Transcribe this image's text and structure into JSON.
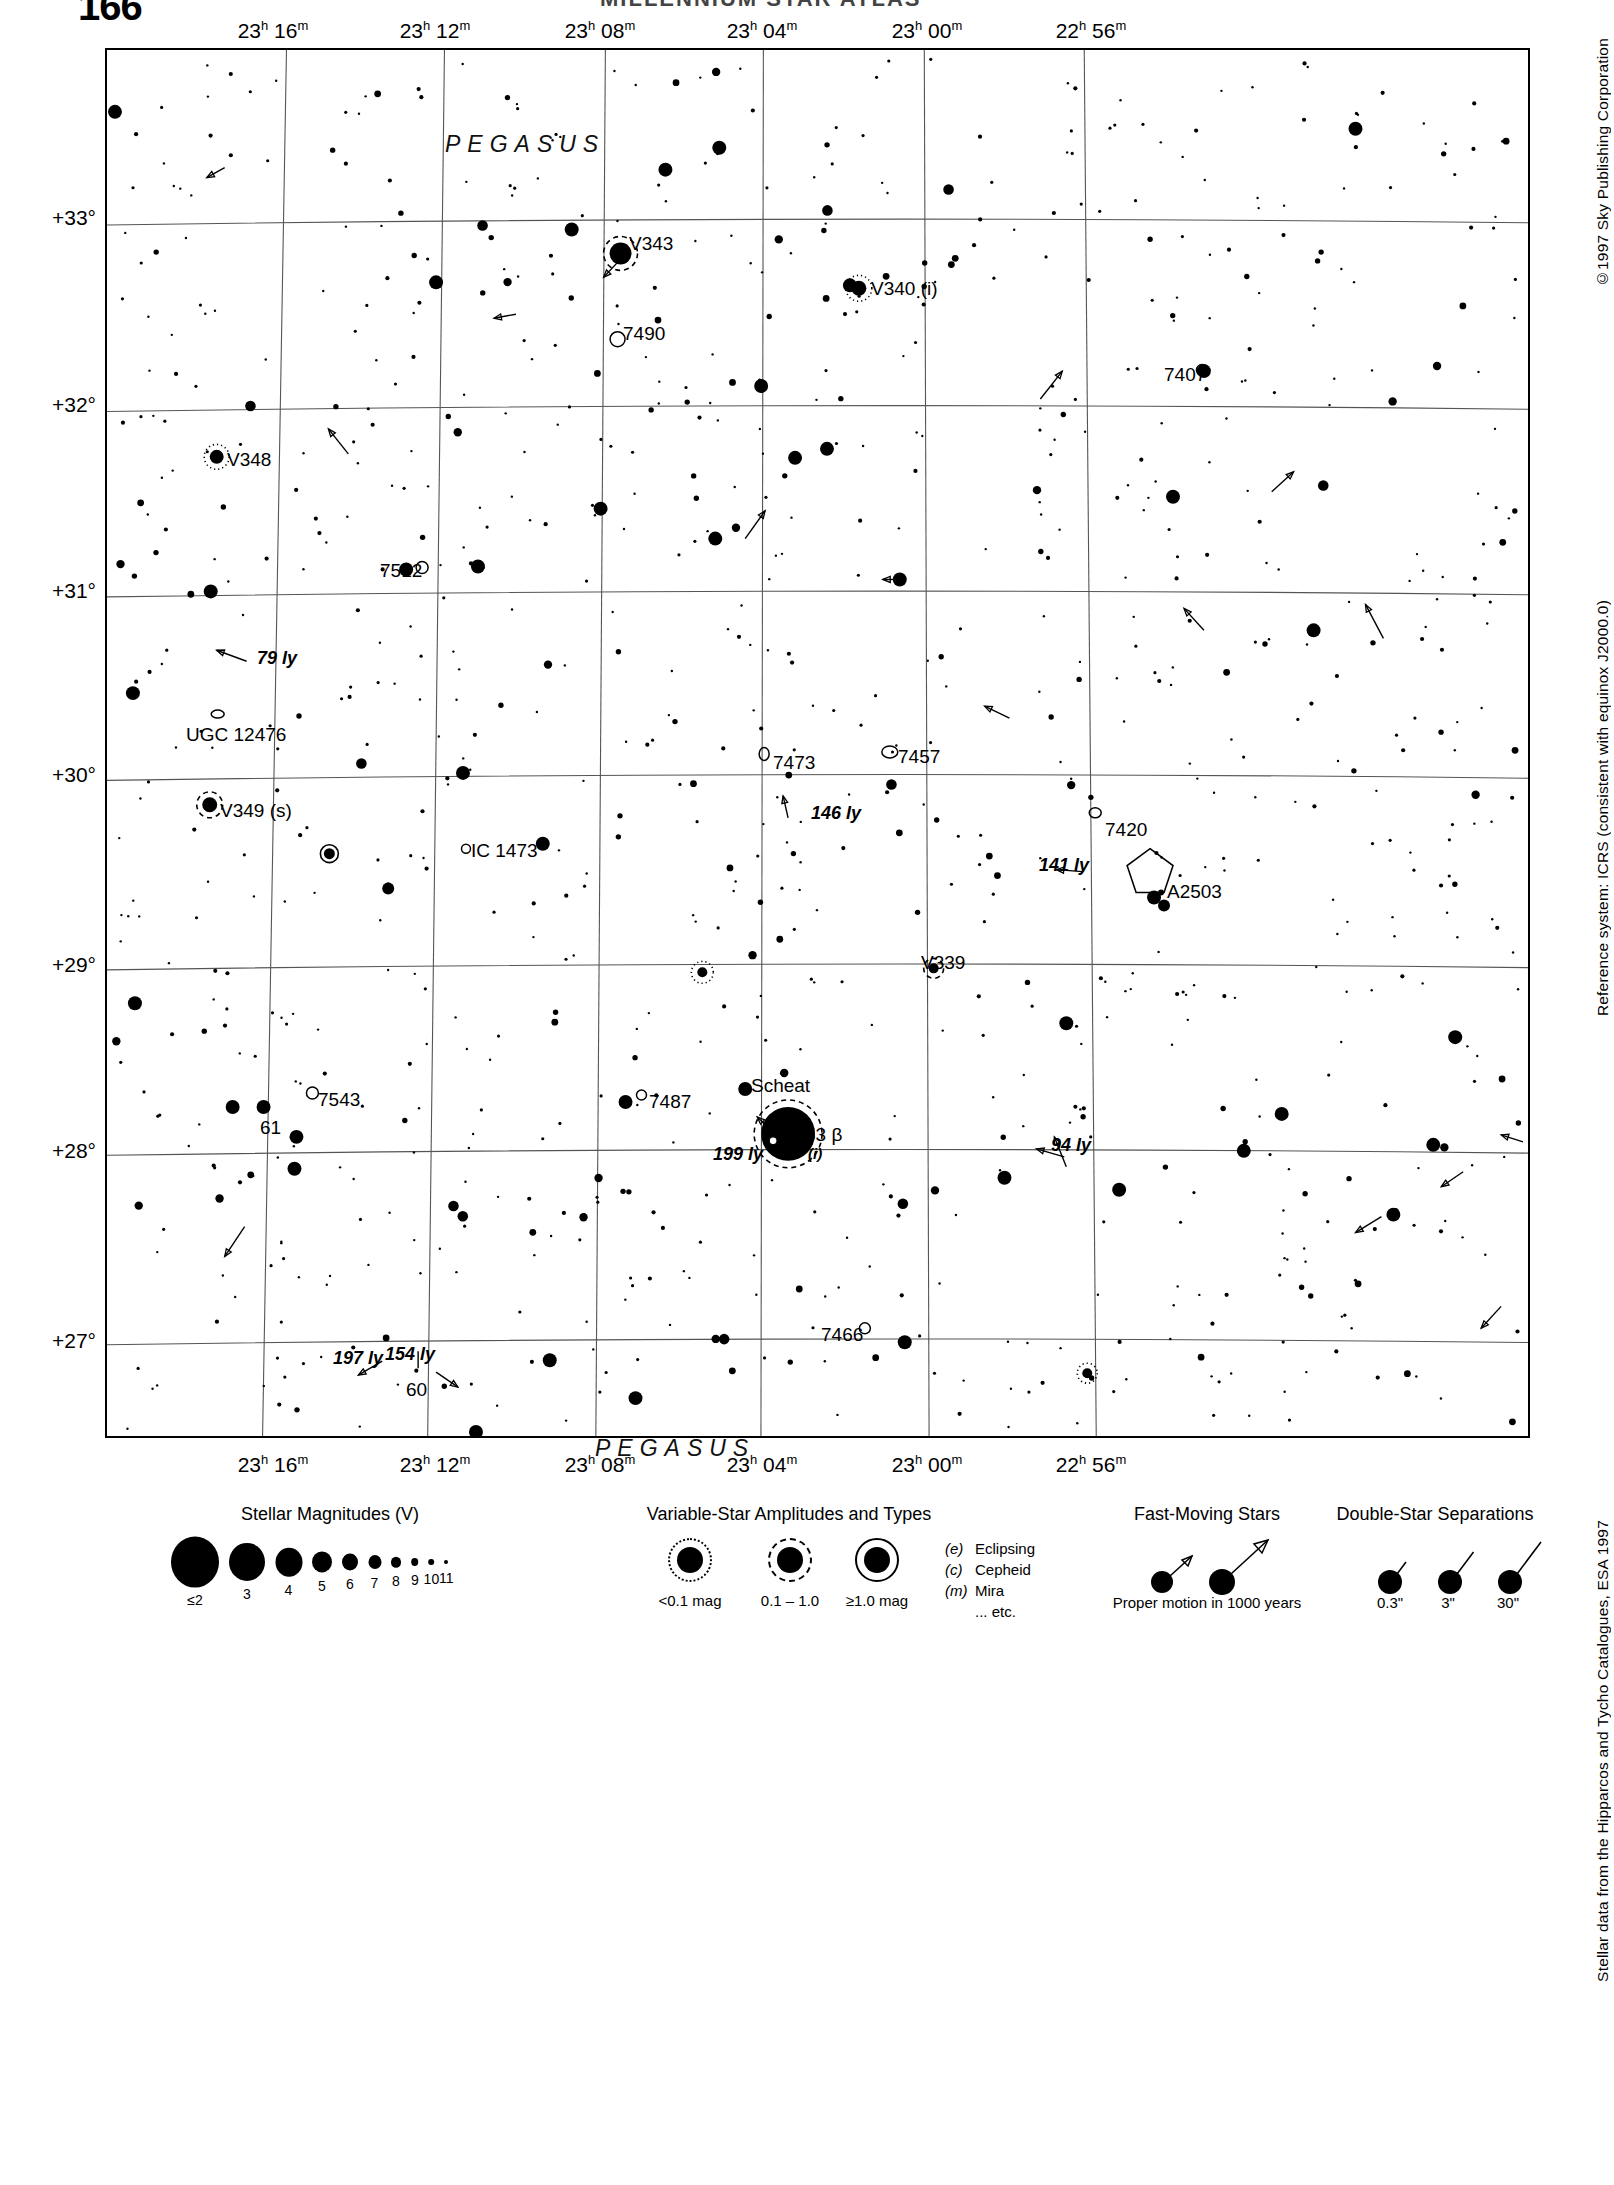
{
  "page": {
    "number_top": "166",
    "header_title": "MILLENNIUM STAR ATLAS",
    "number_legend": "1163",
    "adjacent_chart": "1185"
  },
  "side_notes": {
    "copyright": "©1997 Sky Publishing Corporation",
    "reference": "Reference system: ICRS (consistent with equinox J2000.0)",
    "catalogue": "Stellar data from the Hipparcos and Tycho Catalogues, ESA 1997"
  },
  "axes": {
    "ra_ticks": [
      {
        "label": "23h 16m",
        "h": "23",
        "m": "16",
        "x": 168
      },
      {
        "label": "23h 12m",
        "h": "23",
        "m": "12",
        "x": 330
      },
      {
        "label": "23h 08m",
        "h": "23",
        "m": "08",
        "x": 495
      },
      {
        "label": "23h 04m",
        "h": "23",
        "m": "04",
        "x": 657
      },
      {
        "label": "23h 00m",
        "h": "23",
        "m": "00",
        "x": 822
      },
      {
        "label": "22h 56m",
        "h": "22",
        "m": "56",
        "x": 986
      }
    ],
    "dec_ticks": [
      {
        "label": "+33°",
        "y": 170
      },
      {
        "label": "+32°",
        "y": 357
      },
      {
        "label": "+31°",
        "y": 543
      },
      {
        "label": "+30°",
        "y": 727
      },
      {
        "label": "+29°",
        "y": 917
      },
      {
        "label": "+28°",
        "y": 1103
      },
      {
        "label": "+27°",
        "y": 1293
      }
    ]
  },
  "constellation_labels": [
    {
      "name": "PEGASUS",
      "x": 340,
      "y": 83
    },
    {
      "name": "PEGASUS",
      "x": 490,
      "y": 1387
    }
  ],
  "object_labels": [
    {
      "name": "V343",
      "x": 524,
      "y": 186,
      "style": "plain"
    },
    {
      "name": "V340 (i)",
      "x": 766,
      "y": 231,
      "style": "plain"
    },
    {
      "name": "7490",
      "x": 518,
      "y": 276,
      "style": "plain"
    },
    {
      "name": "7407",
      "x": 1059,
      "y": 317,
      "style": "plain"
    },
    {
      "name": "V348",
      "x": 122,
      "y": 402,
      "style": "plain"
    },
    {
      "name": "7512",
      "x": 275,
      "y": 513,
      "style": "plain"
    },
    {
      "name": "79 ly",
      "x": 152,
      "y": 601,
      "style": "italic"
    },
    {
      "name": "UGC 12476",
      "x": 81,
      "y": 677,
      "style": "plain"
    },
    {
      "name": "7473",
      "x": 668,
      "y": 705,
      "style": "plain"
    },
    {
      "name": "7457",
      "x": 793,
      "y": 699,
      "style": "plain"
    },
    {
      "name": "V349 (s)",
      "x": 115,
      "y": 753,
      "style": "plain"
    },
    {
      "name": "146 ly",
      "x": 706,
      "y": 756,
      "style": "italic"
    },
    {
      "name": "7420",
      "x": 1000,
      "y": 772,
      "style": "plain"
    },
    {
      "name": "IC 1473",
      "x": 366,
      "y": 793,
      "style": "plain"
    },
    {
      "name": "141 ly",
      "x": 934,
      "y": 808,
      "style": "italic"
    },
    {
      "name": "A2503",
      "x": 1062,
      "y": 834,
      "style": "plain"
    },
    {
      "name": "V339",
      "x": 816,
      "y": 905,
      "style": "plain"
    },
    {
      "name": "7543",
      "x": 213,
      "y": 1042,
      "style": "plain"
    },
    {
      "name": "61",
      "x": 155,
      "y": 1070,
      "style": "plain"
    },
    {
      "name": "Scheat",
      "x": 646,
      "y": 1028,
      "style": "plain"
    },
    {
      "name": "7487",
      "x": 544,
      "y": 1044,
      "style": "plain"
    },
    {
      "name": "53 β",
      "x": 700,
      "y": 1077,
      "style": "plain"
    },
    {
      "name": "(i)",
      "x": 703,
      "y": 1098,
      "style": "italic-small"
    },
    {
      "name": "199 ly",
      "x": 608,
      "y": 1097,
      "style": "italic"
    },
    {
      "name": "94 ly",
      "x": 946,
      "y": 1088,
      "style": "italic"
    },
    {
      "name": "7466",
      "x": 716,
      "y": 1277,
      "style": "plain"
    },
    {
      "name": "197 ly",
      "x": 228,
      "y": 1301,
      "style": "italic"
    },
    {
      "name": "154 ly",
      "x": 280,
      "y": 1297,
      "style": "italic"
    },
    {
      "name": "60",
      "x": 301,
      "y": 1332,
      "style": "plain"
    }
  ],
  "legend": {
    "magnitudes": {
      "title": "Stellar Magnitudes (V)",
      "steps": [
        {
          "label": "≤2",
          "r": 24
        },
        {
          "label": "3",
          "r": 18
        },
        {
          "label": "4",
          "r": 13.5
        },
        {
          "label": "5",
          "r": 10
        },
        {
          "label": "6",
          "r": 8
        },
        {
          "label": "7",
          "r": 6.5
        },
        {
          "label": "8",
          "r": 5
        },
        {
          "label": "9",
          "r": 3.8
        },
        {
          "label": "10",
          "r": 2.8
        },
        {
          "label": "11",
          "r": 2
        }
      ]
    },
    "variables": {
      "title": "Variable-Star Amplitudes and Types",
      "samples": [
        {
          "label": "<0.1 mag",
          "ring": "dotted"
        },
        {
          "label": "0.1 – 1.0",
          "ring": "dashed"
        },
        {
          "label": "≥1.0 mag",
          "ring": "solid"
        }
      ],
      "types": [
        {
          "code": "(e)",
          "name": "Eclipsing"
        },
        {
          "code": "(c)",
          "name": "Cepheid"
        },
        {
          "code": "(m)",
          "name": "Mira"
        },
        {
          "code": "",
          "name": "... etc."
        }
      ]
    },
    "fast_moving": {
      "title": "Fast-Moving Stars",
      "caption": "Proper motion in 1000 years"
    },
    "doubles": {
      "title": "Double-Star Separations",
      "labels": [
        "0.3\"",
        "3\"",
        "30\""
      ]
    }
  },
  "chart_data": {
    "type": "scatter",
    "xlabel": "Right Ascension (J2000.0)",
    "ylabel": "Declination (J2000.0)",
    "xlim": [
      "23h 18m",
      "22h 54m"
    ],
    "ylim": [
      "+26.5°",
      "+33.6°"
    ],
    "grid": true,
    "ra_range_minutes": [
      1374,
      1374
    ],
    "seed": 1163,
    "named_objects": [
      {
        "id": "Scheat",
        "bayer": "53 β",
        "type": "variable-star",
        "amplitude": "0.1 - 1.0",
        "mag": 2.4,
        "distance_ly": 199,
        "note": "(i)",
        "x": 683,
        "y": 1087
      },
      {
        "id": "V343",
        "type": "variable-star",
        "amplitude": "0.1 - 1.0",
        "mag": 4.5,
        "x": 515,
        "y": 204
      },
      {
        "id": "V340",
        "type": "variable-star",
        "amplitude": "<0.1 mag",
        "mag": 5.5,
        "note": "(i)",
        "x": 754,
        "y": 239
      },
      {
        "id": "V348",
        "type": "variable-star",
        "amplitude": "<0.1 mag",
        "mag": 5.8,
        "x": 110,
        "y": 408
      },
      {
        "id": "V349",
        "type": "variable-star",
        "amplitude": "0.1 - 1.0",
        "mag": 5.6,
        "note": "(s)",
        "x": 103,
        "y": 757
      },
      {
        "id": "V339",
        "type": "variable-star",
        "amplitude": "<0.1 mag",
        "mag": 7.5,
        "x": 829,
        "y": 921
      },
      {
        "id": "61",
        "type": "star",
        "mag": 3.9,
        "x": 157,
        "y": 1060
      },
      {
        "id": "60",
        "type": "star",
        "mag": 4.2,
        "distance_ly": 154,
        "x": 320,
        "y": 1321
      },
      {
        "id": "7490",
        "type": "nebula",
        "x": 512,
        "y": 290
      },
      {
        "id": "7512",
        "type": "galaxy",
        "x": 316,
        "y": 519
      },
      {
        "id": "7543",
        "type": "galaxy",
        "x": 206,
        "y": 1046
      },
      {
        "id": "7487",
        "type": "galaxy",
        "x": 536,
        "y": 1048
      },
      {
        "id": "7473",
        "type": "galaxy",
        "x": 659,
        "y": 706
      },
      {
        "id": "7457",
        "type": "galaxy",
        "x": 785,
        "y": 704
      },
      {
        "id": "7466",
        "type": "galaxy",
        "x": 760,
        "y": 1282
      },
      {
        "id": "7420",
        "type": "galaxy",
        "x": 991,
        "y": 765
      },
      {
        "id": "7407",
        "type": "galaxy",
        "x": 1098,
        "y": 321
      },
      {
        "id": "IC 1473",
        "type": "galaxy",
        "x": 360,
        "y": 801
      },
      {
        "id": "UGC 12476",
        "type": "galaxy",
        "x": 111,
        "y": 666
      },
      {
        "id": "A2503",
        "type": "galaxy-cluster",
        "x": 1046,
        "y": 827
      }
    ],
    "distance_annotations": [
      {
        "label": "79 ly",
        "x": 152,
        "y": 601
      },
      {
        "label": "146 ly",
        "x": 706,
        "y": 756
      },
      {
        "label": "141 ly",
        "x": 934,
        "y": 808
      },
      {
        "label": "199 ly",
        "x": 608,
        "y": 1097
      },
      {
        "label": "94 ly",
        "x": 946,
        "y": 1088
      },
      {
        "label": "197 ly",
        "x": 228,
        "y": 1301
      },
      {
        "label": "154 ly",
        "x": 280,
        "y": 1297
      }
    ]
  }
}
